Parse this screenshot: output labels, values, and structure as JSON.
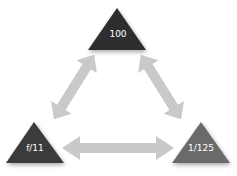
{
  "diagram": {
    "type": "exposure-triangle",
    "nodes": [
      {
        "id": "iso",
        "label": "100",
        "color": "#2e2e2e"
      },
      {
        "id": "aperture",
        "label": "f/11",
        "color": "#3a3a3a"
      },
      {
        "id": "shutter",
        "label": "1/125",
        "color": "#6b6b6b"
      }
    ],
    "edges": [
      {
        "from": "iso",
        "to": "aperture",
        "style": "double-arrow",
        "color": "#c9c9c9"
      },
      {
        "from": "iso",
        "to": "shutter",
        "style": "double-arrow",
        "color": "#c9c9c9"
      },
      {
        "from": "aperture",
        "to": "shutter",
        "style": "double-arrow",
        "color": "#c9c9c9"
      }
    ]
  }
}
